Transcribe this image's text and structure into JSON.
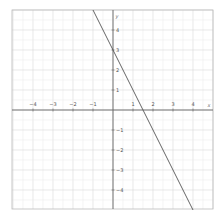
{
  "chart_data": {
    "type": "line",
    "title": "",
    "xlabel": "x",
    "ylabel": "y",
    "xlim": [
      -5,
      5
    ],
    "ylim": [
      -5,
      5
    ],
    "grid": true,
    "grid_minor_step": 0.5,
    "grid_major_step": 1,
    "x_ticks": [
      -4,
      -3,
      -2,
      -1,
      1,
      2,
      3,
      4
    ],
    "x_tick_labels": [
      "−4",
      "−3",
      "−2",
      "−1",
      "1",
      "2",
      "3",
      "4"
    ],
    "y_ticks": [
      4,
      3,
      2,
      1,
      -1,
      -2,
      -3,
      -4
    ],
    "y_tick_labels": [
      "4",
      "3",
      "2",
      "1",
      "−1",
      "−2",
      "−3",
      "−4"
    ],
    "series": [
      {
        "name": "y = -2x + 3",
        "equation": "y = -2x + 3",
        "slope": -2,
        "intercept": 3,
        "x": [
          -1,
          4
        ],
        "y": [
          5,
          -5
        ],
        "color": "#555555"
      }
    ],
    "legend": null
  },
  "colors": {
    "grid_minor": "#ececec",
    "grid_major": "#d8d8d8",
    "axis": "#666666",
    "frame": "#bbbbbb",
    "line": "#555555"
  }
}
